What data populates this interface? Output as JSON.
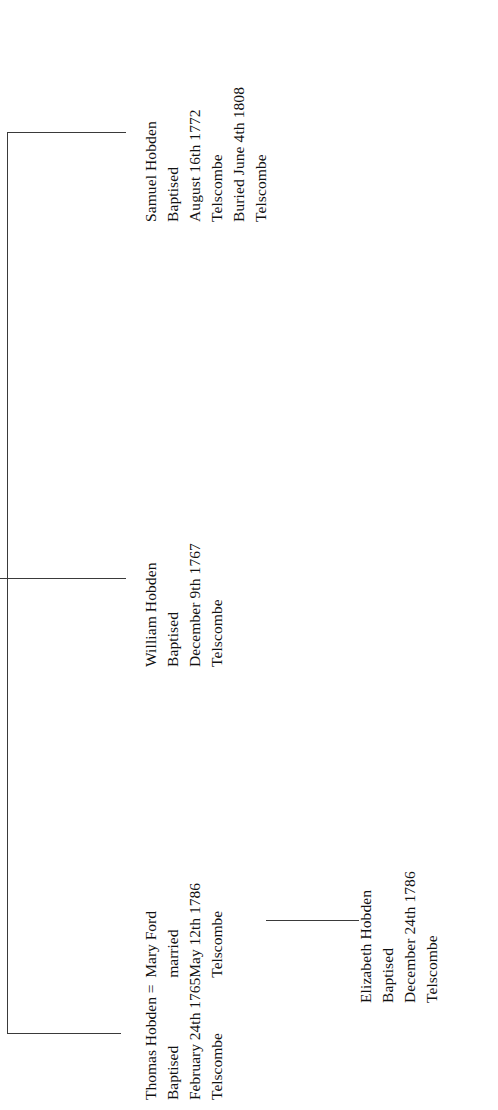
{
  "document": {
    "title": "Hobden Family Tree",
    "orientation": "rotated-90-ccw"
  },
  "colors": {
    "line": "#3a3a3a",
    "text": "#111111",
    "background": "#ffffff"
  },
  "people": {
    "thomas": {
      "name": "Thomas Hobden =",
      "event": "Baptised",
      "date": "February 24th 1765",
      "place": "Telscombe"
    },
    "mary": {
      "name": "Mary Ford",
      "event": "married",
      "date": "May 12th 1786",
      "place": "Telscombe"
    },
    "william": {
      "name": "William Hobden",
      "event": "Baptised",
      "date": "December 9th 1767",
      "place": "Telscombe"
    },
    "samuel": {
      "name": "Samuel Hobden",
      "event": "Baptised",
      "date": "August 16th 1772",
      "place": "Telscombe",
      "burial": "Buried June 4th 1808",
      "burial_place": "Telscombe"
    },
    "elizabeth": {
      "name": "Elizabeth Hobden",
      "event": "Baptised",
      "date": "December 24th 1786",
      "place": "Telscombe"
    }
  }
}
